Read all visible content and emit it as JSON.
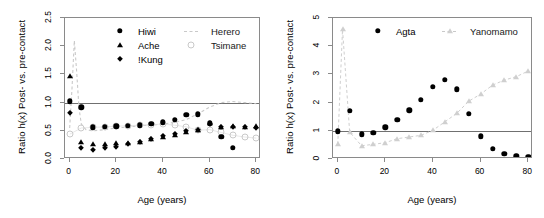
{
  "figure": {
    "panels": [
      {
        "id": "left",
        "ylabel": "Ratio h(x) Post- vs. pre-contact",
        "xlabel": "Age (years)",
        "yticks": [
          "0.0",
          "0.5",
          "1.0",
          "1.5",
          "2.0",
          "2.5"
        ],
        "xticks": [
          "0",
          "20",
          "40",
          "60",
          "80"
        ],
        "legend": [
          {
            "label": "Hiwi",
            "marker": "filled-circle"
          },
          {
            "label": "Ache",
            "marker": "filled-triangle"
          },
          {
            "label": "!Kung",
            "marker": "filled-diamond"
          },
          {
            "label": "Herero",
            "marker": "dashed-line"
          },
          {
            "label": "Tsimane",
            "marker": "open-circle"
          }
        ]
      },
      {
        "id": "right",
        "ylabel": "Ratio h(x) Post- vs. pre-contact",
        "xlabel": "Age (years)",
        "yticks": [
          "0",
          "1",
          "2",
          "3",
          "4",
          "5"
        ],
        "xticks": [
          "0",
          "20",
          "40",
          "60",
          "80"
        ],
        "legend": [
          {
            "label": "Agta",
            "marker": "filled-circle"
          },
          {
            "label": "Yanomamo",
            "marker": "open-triangle-dashed"
          }
        ]
      }
    ]
  },
  "chart_data": [
    {
      "type": "scatter",
      "panel": "left",
      "title": "",
      "xlabel": "Age (years)",
      "ylabel": "Ratio h(x) Post- vs. pre-contact",
      "xlim": [
        -2,
        82
      ],
      "ylim": [
        0.0,
        2.5
      ],
      "yticks": [
        0.0,
        0.5,
        1.0,
        1.5,
        2.0,
        2.5
      ],
      "xticks": [
        0,
        20,
        40,
        60,
        80
      ],
      "grid": false,
      "reference_line": {
        "y": 1.0,
        "color": "#707070"
      },
      "legend_position": "top-center",
      "series": [
        {
          "name": "Hiwi",
          "marker": "filled-circle",
          "color": "#000000",
          "x": [
            0,
            5,
            10,
            15,
            20,
            25,
            30,
            35,
            40,
            45,
            50,
            55,
            60,
            65,
            70
          ],
          "y": [
            1.02,
            0.92,
            0.56,
            0.57,
            0.58,
            0.59,
            0.6,
            0.62,
            0.65,
            0.7,
            0.78,
            0.79,
            0.63,
            0.39,
            0.2
          ]
        },
        {
          "name": "Ache",
          "marker": "filled-triangle",
          "color": "#000000",
          "x": [
            0,
            5,
            10,
            15,
            20,
            25,
            30,
            35,
            40,
            45,
            50,
            55,
            60,
            65,
            70,
            75,
            80
          ],
          "y": [
            1.48,
            0.3,
            0.27,
            0.27,
            0.29,
            0.28,
            0.31,
            0.35,
            0.39,
            0.43,
            0.47,
            0.52,
            0.63,
            0.56,
            0.58,
            0.57,
            0.58
          ]
        },
        {
          "name": "!Kung",
          "marker": "filled-diamond",
          "color": "#000000",
          "x": [
            0,
            5,
            10,
            15,
            20,
            25,
            30,
            35,
            40,
            45,
            50,
            55,
            60,
            65,
            70,
            75,
            80
          ],
          "y": [
            0.82,
            0.19,
            0.16,
            0.19,
            0.21,
            0.26,
            0.31,
            0.36,
            0.41,
            0.45,
            0.49,
            0.52,
            0.62,
            0.56,
            0.57,
            0.56,
            0.55
          ]
        },
        {
          "name": "Herero",
          "marker": "dashed-line",
          "color": "#c9c9c9",
          "x": [
            0,
            1,
            2,
            3,
            4,
            5,
            7,
            10,
            15,
            20,
            25,
            30,
            35,
            40,
            45,
            50,
            55,
            60,
            65,
            70,
            75,
            80
          ],
          "y": [
            0.55,
            1.25,
            2.1,
            1.55,
            0.9,
            0.62,
            0.52,
            0.5,
            0.52,
            0.55,
            0.57,
            0.59,
            0.6,
            0.62,
            0.65,
            0.7,
            0.8,
            0.92,
            1.0,
            1.02,
            1.0,
            0.98
          ]
        },
        {
          "name": "Tsimane",
          "marker": "open-circle",
          "color": "#c9c9c9",
          "x": [
            0,
            5,
            10,
            15,
            20,
            25,
            30,
            35,
            40,
            45,
            50,
            55,
            60,
            65,
            70,
            75,
            80
          ],
          "y": [
            0.44,
            0.55,
            0.56,
            0.57,
            0.58,
            0.59,
            0.6,
            0.61,
            0.62,
            0.6,
            0.57,
            0.51,
            0.52,
            0.47,
            0.42,
            0.39,
            0.37
          ]
        }
      ]
    },
    {
      "type": "scatter",
      "panel": "right",
      "title": "",
      "xlabel": "Age (years)",
      "ylabel": "Ratio h(x) Post- vs. pre-contact",
      "xlim": [
        -2,
        82
      ],
      "ylim": [
        0,
        5
      ],
      "yticks": [
        0,
        1,
        2,
        3,
        4,
        5
      ],
      "xticks": [
        0,
        20,
        40,
        60,
        80
      ],
      "grid": false,
      "reference_line": {
        "y": 1.0,
        "color": "#707070"
      },
      "legend_position": "top-center",
      "series": [
        {
          "name": "Agta",
          "marker": "filled-circle",
          "color": "#000000",
          "x": [
            0,
            5,
            10,
            15,
            20,
            25,
            30,
            35,
            40,
            45,
            50,
            55,
            60,
            65,
            70,
            75,
            80
          ],
          "y": [
            0.98,
            1.7,
            0.87,
            0.92,
            1.12,
            1.38,
            1.72,
            2.1,
            2.56,
            2.8,
            2.47,
            1.6,
            0.81,
            0.36,
            0.18,
            0.1,
            0.07
          ]
        },
        {
          "name": "Yanomamo",
          "marker": "open-triangle-dashed",
          "color": "#cfcfcf",
          "x": [
            0,
            2,
            5,
            10,
            15,
            20,
            25,
            30,
            35,
            40,
            45,
            50,
            55,
            60,
            65,
            70,
            75,
            80
          ],
          "y": [
            0.52,
            4.6,
            0.95,
            0.47,
            0.52,
            0.58,
            0.72,
            0.78,
            0.84,
            1.02,
            1.32,
            1.62,
            2.05,
            2.3,
            2.62,
            2.8,
            2.92,
            3.12
          ]
        }
      ]
    }
  ]
}
